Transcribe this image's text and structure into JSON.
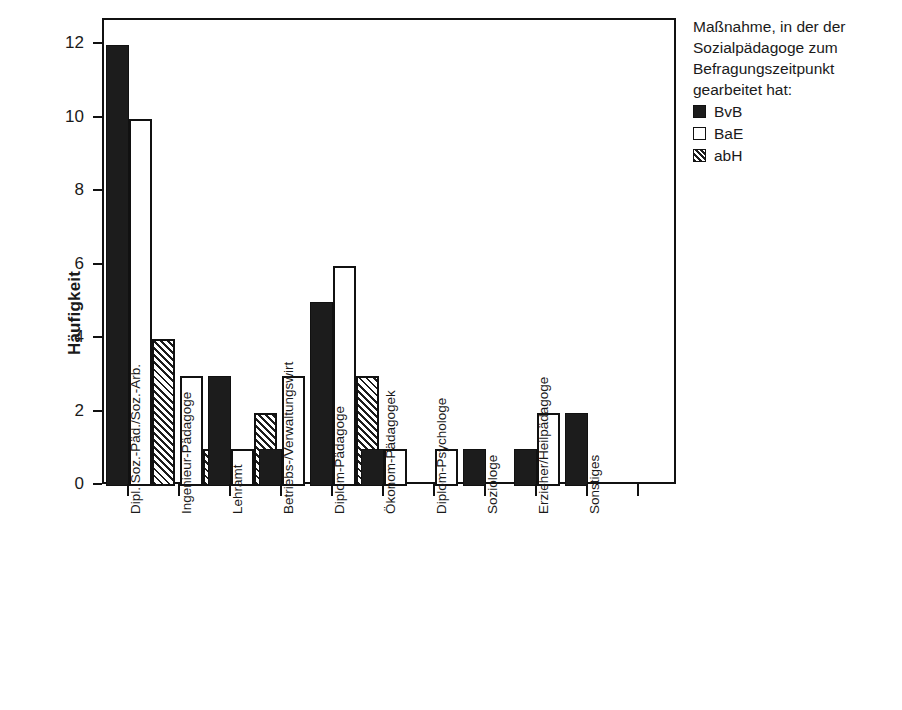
{
  "chart_data": {
    "type": "bar",
    "title": "",
    "xlabel": "",
    "ylabel": "Häufigkeit",
    "ylim": [
      0,
      12
    ],
    "yticks": [
      0,
      2,
      4,
      6,
      8,
      10,
      12
    ],
    "grid": false,
    "legend_position": "right",
    "legend_title": "Maßnahme, in der der\nSozialpädagoge zum\nBefragungszeitpunkt\ngearbeitet hat:",
    "categories": [
      "Dipl. Soz.-Päd./Soz.-Arb.",
      "Ingenieur-Pädagoge",
      "Lehramt",
      "Betriebs-/Verwaltungswirt",
      "Diplom-Pädagoge",
      "Ökonom-Pädagogek",
      "Diplom-Psychologe",
      "Soziologe",
      "Erzieher/Heilpädagoge",
      "Sonstiges"
    ],
    "series": [
      {
        "name": "BvB",
        "fill": "solid-black",
        "color": "#1c1c1c",
        "values": [
          12,
          0,
          3,
          1,
          5,
          1,
          0,
          1,
          1,
          2
        ]
      },
      {
        "name": "BaE",
        "fill": "white-outline",
        "color": "#ffffff",
        "values": [
          10,
          3,
          1,
          3,
          6,
          1,
          1,
          0,
          2,
          0
        ]
      },
      {
        "name": "abH",
        "fill": "diagonal-hatch",
        "color": "#ffffff",
        "values": [
          4,
          1,
          2,
          0,
          3,
          0,
          0,
          0,
          0,
          0
        ]
      }
    ]
  }
}
